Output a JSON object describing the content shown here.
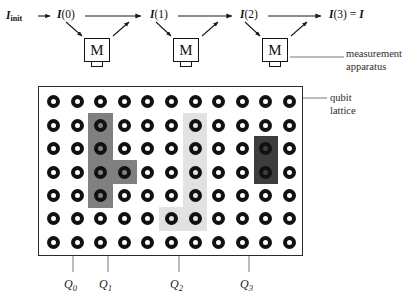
{
  "figure": {
    "width": 418,
    "height": 305,
    "background": "#ffffff"
  },
  "flow": {
    "nodes": [
      {
        "id": "init",
        "text": "I",
        "sub": "init",
        "paren": "",
        "x": 6,
        "y": 10
      },
      {
        "id": "i0",
        "text": "I",
        "sub": "",
        "paren": "(0)",
        "x": 57,
        "y": 9
      },
      {
        "id": "i1",
        "text": "I",
        "sub": "",
        "paren": "(1)",
        "x": 150,
        "y": 9
      },
      {
        "id": "i2",
        "text": "I",
        "sub": "",
        "paren": "(2)",
        "x": 240,
        "y": 9
      },
      {
        "id": "i3",
        "text": "I",
        "sub": "",
        "paren": "(3)",
        "eq": " = ",
        "tail": "I",
        "x": 329,
        "y": 9
      }
    ],
    "measurement_boxes": [
      {
        "id": "m0",
        "label": "M",
        "x": 84,
        "y": 38
      },
      {
        "id": "m1",
        "label": "M",
        "x": 173,
        "y": 38
      },
      {
        "id": "m2",
        "label": "M",
        "x": 262,
        "y": 38
      }
    ]
  },
  "callouts": {
    "measurement": {
      "line1": "measurement",
      "line2": "apparatus",
      "x": 346,
      "y": 47
    },
    "lattice": {
      "line1": "qubit",
      "line2": "lattice",
      "x": 330,
      "y": 91
    }
  },
  "lattice": {
    "x": 38,
    "y": 86,
    "width": 265,
    "height": 170,
    "cols": 11,
    "rows": 7,
    "cell_w": 23.6,
    "cell_h": 23.4,
    "qubit_outer": 13,
    "qubit_ring": 4,
    "qubit_color": "#111111",
    "regions": [
      {
        "id": "region-q1",
        "name": "dark-gray-region",
        "color": "#808080",
        "cells": [
          {
            "col": 2,
            "row": 1
          },
          {
            "col": 2,
            "row": 2
          },
          {
            "col": 2,
            "row": 3
          },
          {
            "col": 2,
            "row": 4
          },
          {
            "col": 3,
            "row": 3
          }
        ]
      },
      {
        "id": "region-q2",
        "name": "light-gray-region",
        "color": "#e2e2e2",
        "cells": [
          {
            "col": 6,
            "row": 1
          },
          {
            "col": 6,
            "row": 2
          },
          {
            "col": 6,
            "row": 3
          },
          {
            "col": 6,
            "row": 4
          },
          {
            "col": 6,
            "row": 5
          },
          {
            "col": 5,
            "row": 5
          }
        ]
      },
      {
        "id": "region-q3",
        "name": "darkest-region",
        "color": "#3d3d3d",
        "cells": [
          {
            "col": 9,
            "row": 2
          },
          {
            "col": 9,
            "row": 3
          }
        ]
      }
    ]
  },
  "qubit_labels": [
    {
      "id": "Q0",
      "text": "Q",
      "sub": "0",
      "leader_x": 73,
      "label_x": 64,
      "label_y": 278,
      "leader_top": 256,
      "leader_bottom": 272
    },
    {
      "id": "Q1",
      "text": "Q",
      "sub": "1",
      "leader_x": 108,
      "label_x": 99,
      "label_y": 278,
      "leader_top": 202,
      "leader_bottom": 272
    },
    {
      "id": "Q2",
      "text": "Q",
      "sub": "2",
      "leader_x": 179,
      "label_x": 170,
      "label_y": 278,
      "leader_top": 238,
      "leader_bottom": 272
    },
    {
      "id": "Q3",
      "text": "Q",
      "sub": "3",
      "leader_x": 249,
      "label_x": 240,
      "label_y": 278,
      "leader_top": 166,
      "leader_bottom": 272
    }
  ]
}
